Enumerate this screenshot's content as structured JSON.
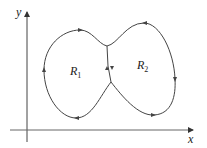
{
  "diagram": {
    "axes": {
      "x_label": "x",
      "y_label": "y"
    },
    "regions": [
      {
        "name": "R",
        "subscript": "1"
      },
      {
        "name": "R",
        "subscript": "2"
      }
    ],
    "colors": {
      "stroke": "#444444",
      "background": "#ffffff"
    }
  }
}
